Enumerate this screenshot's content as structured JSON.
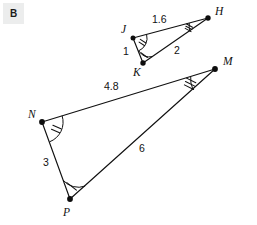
{
  "badge": {
    "label": "B",
    "background": "#eceded",
    "text_color": "#1b1b1b"
  },
  "colors": {
    "stroke": "#111111",
    "background": "#ffffff",
    "vertex": "#0d0d0d"
  },
  "figure": {
    "kind": "similar-triangles-diagram"
  },
  "triangles": [
    {
      "name": "triangle-JKH",
      "vertices": [
        {
          "id": "J",
          "label": "J",
          "x": 133,
          "y": 38,
          "label_x": 121,
          "label_y": 33,
          "angle_ticks": 2
        },
        {
          "id": "H",
          "label": "H",
          "x": 208,
          "y": 18,
          "label_x": 215,
          "label_y": 15,
          "angle_ticks": 3
        },
        {
          "id": "K",
          "label": "K",
          "x": 143,
          "y": 63,
          "label_x": 133,
          "label_y": 76,
          "angle_ticks": 1
        }
      ],
      "sides": [
        {
          "id": "JH",
          "from": "J",
          "to": "H",
          "length_label": "1.6",
          "label_x": 152,
          "label_y": 23
        },
        {
          "id": "JK",
          "from": "J",
          "to": "K",
          "length_label": "1",
          "label_x": 123,
          "label_y": 55
        },
        {
          "id": "KH",
          "from": "K",
          "to": "H",
          "length_label": "2",
          "label_x": 174,
          "label_y": 54
        }
      ]
    },
    {
      "name": "triangle-NPM",
      "vertices": [
        {
          "id": "N",
          "label": "N",
          "x": 42,
          "y": 122,
          "label_x": 28,
          "label_y": 118,
          "angle_ticks": 2
        },
        {
          "id": "M",
          "label": "M",
          "x": 215,
          "y": 69,
          "label_x": 223,
          "label_y": 65,
          "angle_ticks": 3
        },
        {
          "id": "P",
          "label": "P",
          "x": 70,
          "y": 199,
          "label_x": 63,
          "label_y": 216,
          "angle_ticks": 1
        }
      ],
      "sides": [
        {
          "id": "NM",
          "from": "N",
          "to": "M",
          "length_label": "4.8",
          "label_x": 104,
          "label_y": 90
        },
        {
          "id": "NP",
          "from": "N",
          "to": "P",
          "length_label": "3",
          "label_x": 43,
          "label_y": 166
        },
        {
          "id": "PM",
          "from": "P",
          "to": "M",
          "length_label": "6",
          "label_x": 139,
          "label_y": 152
        }
      ]
    }
  ]
}
